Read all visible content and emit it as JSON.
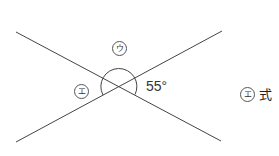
{
  "diagram": {
    "lines": [
      {
        "x1": 16,
        "y1": 32,
        "x2": 221,
        "y2": 141
      },
      {
        "x1": 16,
        "y1": 142,
        "x2": 222,
        "y2": 31
      }
    ],
    "intersection": {
      "x": 119,
      "y": 86
    },
    "arc": {
      "radius": 18,
      "covers": [
        "ウ",
        "エ",
        "55°"
      ]
    },
    "labels": {
      "top_angle": "ウ",
      "left_angle": "エ",
      "right_angle": "55°"
    },
    "line_color": "#444444"
  },
  "answer": {
    "marker": "エ",
    "text": "式"
  }
}
